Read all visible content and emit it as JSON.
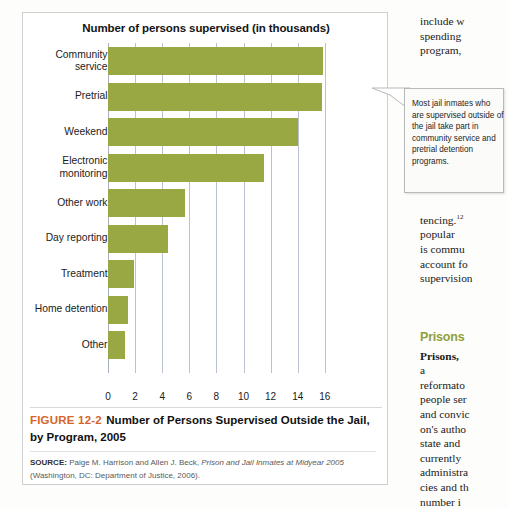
{
  "figure": {
    "chart_title": "Number of persons supervised (in thousands)",
    "caption_number": "FIGURE 12-2",
    "caption_title": "Number of Persons Supervised Outside the Jail, by Program, 2005",
    "source_label": "SOURCE:",
    "source_text_1": "Paige M. Harrison and Allen J. Beck,",
    "source_italic": "Prison and Jail Inmates at Midyear 2005",
    "source_text_2": "(Washington, DC: Department of Justice, 2006)."
  },
  "callout": {
    "text": "Most jail inmates who are supervised outside of the jail take part in community service and pretrial detention programs."
  },
  "body": {
    "top": "include w\nspending\nprogram,",
    "mid_1": "tencing.",
    "mid_sup": "12",
    "mid_2": "popular\nis commu\naccount fo\nsupervision",
    "prisons_heading": "Prisons",
    "bottom_term": "Prisons,",
    "bottom_text": "a\nreformato\npeople ser\nand convic\non's autho\nstate and\ncurrently\nadministra\ncies and th\nnumber i"
  },
  "colors": {
    "bar": "#9aa843",
    "figure_number": "#d4662a",
    "section_heading": "#8fa03c",
    "gridline": "#b9c0d0"
  },
  "chart_data": {
    "type": "bar",
    "orientation": "horizontal",
    "title": "Number of persons supervised (in thousands)",
    "xlabel": "",
    "ylabel": "",
    "categories": [
      "Community\nservice",
      "Pretrial",
      "Weekend",
      "Electronic\nmonitoring",
      "Other work",
      "Day reporting",
      "Treatment",
      "Home detention",
      "Other"
    ],
    "values": [
      15.9,
      15.8,
      14.0,
      11.5,
      5.7,
      4.4,
      1.95,
      1.45,
      1.25
    ],
    "xticks": [
      0,
      2,
      4,
      6,
      8,
      10,
      12,
      14,
      16
    ],
    "xlim": [
      0,
      16
    ],
    "grid": true,
    "legend": false
  }
}
